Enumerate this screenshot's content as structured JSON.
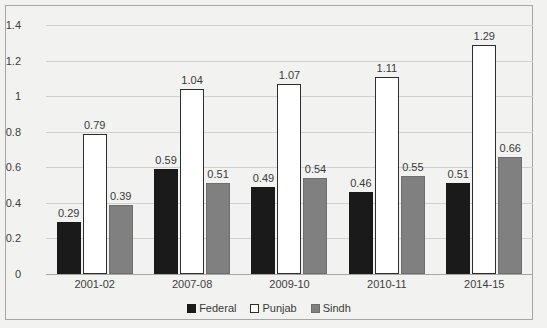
{
  "chart_data": {
    "type": "bar",
    "title": "",
    "subtitle": "",
    "xlabel": "",
    "ylabel": "",
    "ylim": [
      0,
      1.4
    ],
    "yticks": [
      "0",
      "0.2",
      "0.4",
      "0.6",
      "0.8",
      "1",
      "1.2",
      "1.4"
    ],
    "ytick_values": [
      0,
      0.2,
      0.4,
      0.6,
      0.8,
      1,
      1.2,
      1.4
    ],
    "grid": true,
    "legend_position": "bottom",
    "categories": [
      "2001-02",
      "2007-08",
      "2009-10",
      "2010-11",
      "2014-15"
    ],
    "series": [
      {
        "name": "Federal",
        "color": "#1a1a1a",
        "values": [
          0.29,
          0.59,
          0.49,
          0.46,
          0.51
        ],
        "labels": [
          "0.29",
          "0.59",
          "0.49",
          "0.46",
          "0.51"
        ]
      },
      {
        "name": "Punjab",
        "color": "#ffffff",
        "values": [
          0.79,
          1.04,
          1.07,
          1.11,
          1.29
        ],
        "labels": [
          "0.79",
          "1.04",
          "1.07",
          "1.11",
          "1.29"
        ]
      },
      {
        "name": "Sindh",
        "color": "#808080",
        "values": [
          0.39,
          0.51,
          0.54,
          0.55,
          0.66
        ],
        "labels": [
          "0.39",
          "0.51",
          "0.54",
          "0.55",
          "0.66"
        ]
      }
    ]
  },
  "legend": {
    "items": [
      {
        "label": "Federal",
        "swatch": "federal"
      },
      {
        "label": "Punjab",
        "swatch": "punjab"
      },
      {
        "label": "Sindh",
        "swatch": "sindh"
      }
    ]
  },
  "colors": {
    "background": "#f2f2f0",
    "border": "#a6a6a6",
    "gridline": "#d0d0d0",
    "axis": "#a6a6a6",
    "text": "#404040",
    "federal": "#1a1a1a",
    "punjab": "#ffffff",
    "sindh": "#808080"
  }
}
